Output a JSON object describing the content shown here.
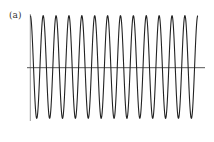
{
  "panel_label": "(a)",
  "chart_data": {
    "type": "line",
    "title": "",
    "panel_label": "(a)",
    "xlabel": "",
    "ylabel": "",
    "grid": false,
    "legend": null,
    "series": [
      {
        "name": "cosine wave",
        "function": "cos",
        "periods": 13,
        "amplitude": 1,
        "phase_start": "peak",
        "phase_end": "peak",
        "color": "#222222"
      }
    ],
    "xlim": [
      0,
      13
    ],
    "ylim": [
      -1,
      1
    ],
    "axes": {
      "x_axis_at": 0,
      "y_axis_at": 0,
      "color": "#555555"
    },
    "layout_px": {
      "x0": 30.3,
      "x1": 197.8,
      "y_top": 15.7,
      "y_bottom": 118.3,
      "y_zero": 67.7,
      "hline_x0": 27,
      "hline_x1": 205,
      "vline_y0": 14,
      "vline_y1": 121
    }
  }
}
